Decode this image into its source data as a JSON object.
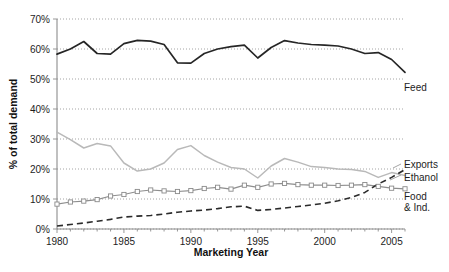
{
  "chart_data": {
    "type": "line",
    "title": "",
    "xlabel": "Marketing Year",
    "ylabel": "% of total demand",
    "xlim": [
      1980,
      2006
    ],
    "ylim": [
      0,
      70
    ],
    "grid": true,
    "legend_position": "right-inline",
    "x_tick_labels": [
      "1980",
      "1985",
      "1990",
      "1995",
      "2000",
      "2005"
    ],
    "x_tick_values": [
      1980,
      1985,
      1990,
      1995,
      2000,
      2005
    ],
    "y_tick_labels": [
      "0%",
      "10%",
      "20%",
      "30%",
      "40%",
      "50%",
      "60%",
      "70%"
    ],
    "y_tick_values": [
      0,
      10,
      20,
      30,
      40,
      50,
      60,
      70
    ],
    "x": [
      1980,
      1981,
      1982,
      1983,
      1984,
      1985,
      1986,
      1987,
      1988,
      1989,
      1990,
      1991,
      1992,
      1993,
      1994,
      1995,
      1996,
      1997,
      1998,
      1999,
      2000,
      2001,
      2002,
      2003,
      2004,
      2005,
      2006
    ],
    "series": [
      {
        "name": "Feed",
        "label": "Feed",
        "color": "#262626",
        "style": "solid",
        "values": [
          58.3,
          60.0,
          62.5,
          58.5,
          58.3,
          61.8,
          62.9,
          62.6,
          61.5,
          55.4,
          55.3,
          58.5,
          60.0,
          60.8,
          61.3,
          57.0,
          60.5,
          62.8,
          62.0,
          61.5,
          61.3,
          61.0,
          60.0,
          58.5,
          58.8,
          56.5,
          52.2
        ]
      },
      {
        "name": "Exports",
        "label": "Exports",
        "color": "#b9b9b9",
        "style": "solid",
        "values": [
          32.3,
          29.8,
          27.0,
          28.5,
          27.7,
          22.0,
          19.3,
          20.0,
          22.0,
          26.5,
          27.8,
          24.5,
          22.3,
          20.5,
          20.0,
          17.0,
          21.0,
          23.5,
          22.3,
          20.8,
          20.5,
          20.0,
          19.8,
          19.2,
          17.2,
          18.8,
          17.8
        ]
      },
      {
        "name": "Food & Ind.",
        "label": "Food & Ind.",
        "color": "#8e8e8e",
        "style": "solid-markers",
        "values": [
          8.3,
          9.0,
          9.3,
          9.8,
          11.0,
          11.5,
          12.5,
          13.0,
          12.7,
          12.5,
          12.8,
          13.5,
          13.9,
          13.3,
          14.6,
          13.9,
          15.0,
          15.2,
          14.8,
          14.6,
          14.6,
          14.5,
          14.6,
          14.8,
          14.2,
          13.6,
          13.4
        ]
      },
      {
        "name": "Ethanol",
        "label": "Ethanol",
        "color": "#2b2b2b",
        "style": "dashed",
        "values": [
          1.0,
          1.5,
          2.0,
          2.6,
          3.2,
          4.0,
          4.3,
          4.5,
          5.0,
          5.6,
          6.0,
          6.3,
          6.8,
          7.4,
          7.6,
          6.2,
          6.5,
          7.0,
          7.5,
          8.0,
          8.6,
          9.4,
          10.5,
          12.2,
          15.0,
          17.2,
          19.8
        ]
      }
    ]
  },
  "labels": {
    "feed": "Feed",
    "exports": "Exports",
    "ethanol": "Ethanol",
    "food_line1": "Food",
    "food_line2": "& Ind.",
    "x_axis_title": "Marketing Year",
    "y_axis_title": "% of total demand"
  },
  "ticks": {
    "y": [
      "70%",
      "60%",
      "50%",
      "40%",
      "30%",
      "20%",
      "10%",
      "0%"
    ],
    "x": [
      "1980",
      "1985",
      "1990",
      "1995",
      "2000",
      "2005"
    ]
  }
}
